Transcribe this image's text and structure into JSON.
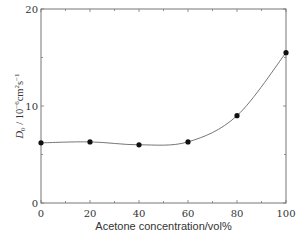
{
  "chart_data": {
    "type": "line",
    "title": "",
    "xlabel": "Acetone concentration/vol%",
    "ylabel": "D0 / 10^-6 cm^2 s^-1",
    "ylabel_parts": {
      "symbol": "D",
      "subscript": "0",
      "unit_prefix": " / 10",
      "exp1": "−6",
      "unit_mid": "cm",
      "exp2": "2",
      "unit_s": "s",
      "exp3": "−1"
    },
    "x": [
      0,
      20,
      40,
      60,
      80,
      100
    ],
    "series": [
      {
        "name": "D0",
        "values": [
          6.2,
          6.3,
          6.0,
          6.3,
          9.0,
          15.5
        ],
        "marker": "filled-circle",
        "line": "smooth"
      }
    ],
    "xlim": [
      0,
      100
    ],
    "ylim": [
      0,
      20
    ],
    "x_ticks": [
      "0",
      "20",
      "40",
      "60",
      "80",
      "100"
    ],
    "y_ticks": [
      "0",
      "10",
      "20"
    ],
    "x_minor_step": 10,
    "y_minor_step": 5,
    "grid": false,
    "legend": null,
    "colors": {
      "axis": "#777777",
      "line": "#666666",
      "marker": "#111111"
    }
  }
}
